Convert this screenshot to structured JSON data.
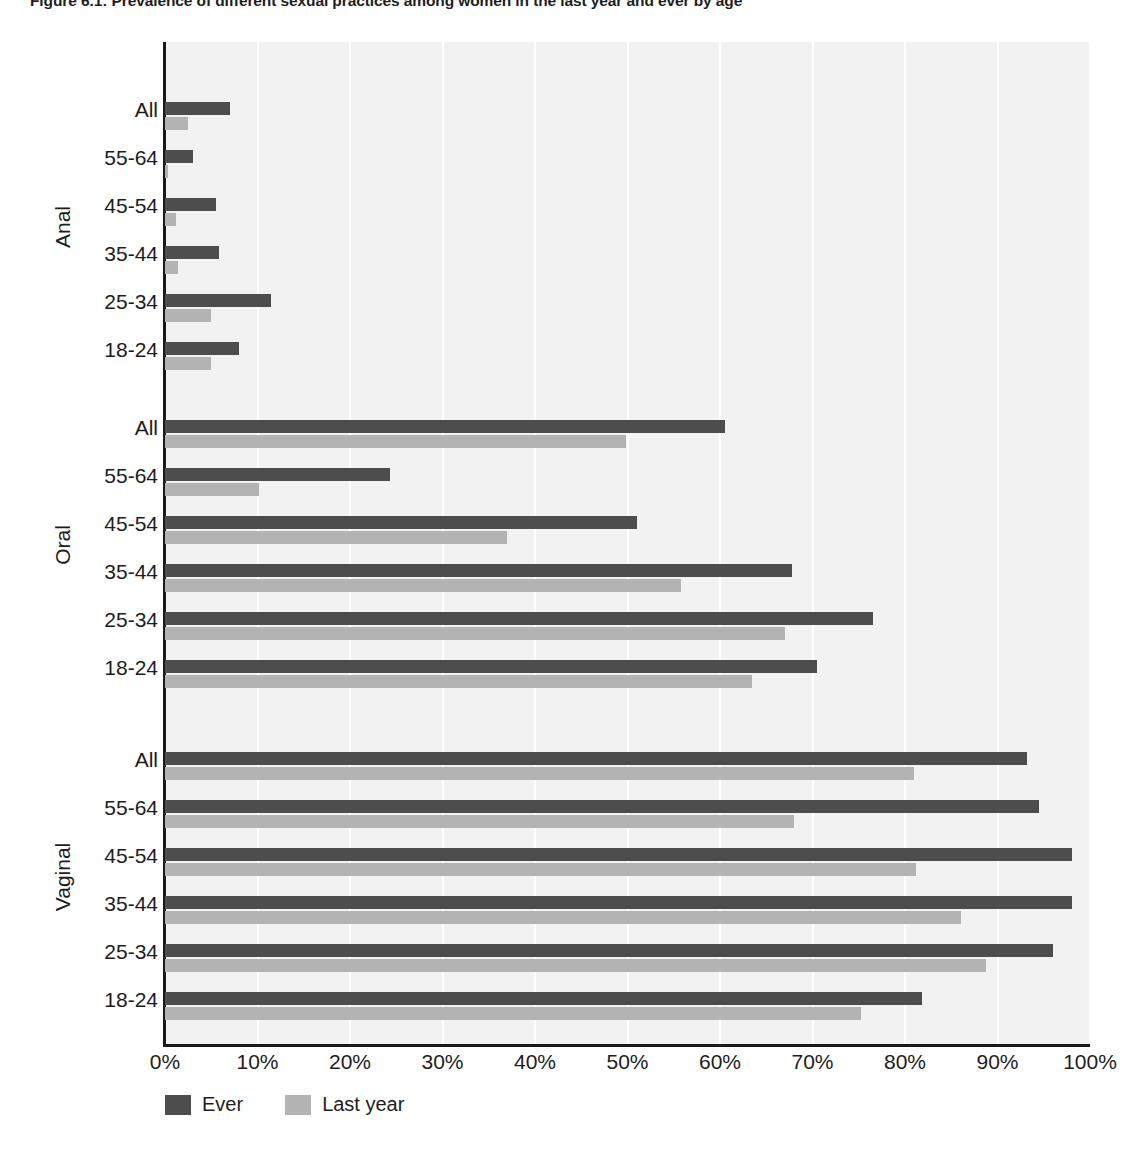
{
  "figure": {
    "title": "Figure 6.1: Prevalence of different sexual practices among women in the last year and ever by age"
  },
  "legend": {
    "series": [
      {
        "label": "Ever",
        "color": "#4d4d4d"
      },
      {
        "label": "Last year",
        "color": "#b3b3b3"
      }
    ]
  },
  "axis": {
    "x_ticks": [
      "0%",
      "10%",
      "20%",
      "30%",
      "40%",
      "50%",
      "60%",
      "70%",
      "80%",
      "90%",
      "100%"
    ],
    "x_min": 0,
    "x_max": 100
  },
  "groups": [
    {
      "name": "Anal"
    },
    {
      "name": "Oral"
    },
    {
      "name": "Vaginal"
    }
  ],
  "age_labels": [
    "All",
    "55-64",
    "45-54",
    "35-44",
    "25-34",
    "18-24"
  ],
  "chart_data": {
    "type": "bar",
    "orientation": "horizontal",
    "title": "Figure 6.1: Prevalence of different sexual practices among women in the last year and ever by age",
    "xlabel": "",
    "ylabel": "",
    "xlim": [
      0,
      100
    ],
    "xticks": [
      0,
      10,
      20,
      30,
      40,
      50,
      60,
      70,
      80,
      90,
      100
    ],
    "xtick_labels": [
      "0%",
      "10%",
      "20%",
      "30%",
      "40%",
      "50%",
      "60%",
      "70%",
      "80%",
      "90%",
      "100%"
    ],
    "grid": "vertical",
    "legend_position": "bottom-left",
    "legend_entries": [
      "Ever",
      "Last year"
    ],
    "categories": [
      "All",
      "55-64",
      "45-54",
      "35-44",
      "25-34",
      "18-24"
    ],
    "panels": [
      {
        "name": "Anal",
        "series": [
          {
            "name": "Ever",
            "color": "#4d4d4d",
            "values": [
              7.0,
              3.0,
              5.5,
              5.8,
              11.5,
              8.0
            ]
          },
          {
            "name": "Last year",
            "color": "#b3b3b3",
            "values": [
              2.5,
              0.3,
              1.2,
              1.4,
              5.0,
              5.0
            ]
          }
        ]
      },
      {
        "name": "Oral",
        "series": [
          {
            "name": "Ever",
            "color": "#4d4d4d",
            "values": [
              60.5,
              24.3,
              51.0,
              67.8,
              76.5,
              70.5
            ]
          },
          {
            "name": "Last year",
            "color": "#b3b3b3",
            "values": [
              49.8,
              10.2,
              37.0,
              55.8,
              67.0,
              63.5
            ]
          }
        ]
      },
      {
        "name": "Vaginal",
        "series": [
          {
            "name": "Ever",
            "color": "#4d4d4d",
            "values": [
              93.2,
              94.5,
              98.0,
              98.0,
              96.0,
              81.8
            ]
          },
          {
            "name": "Last year",
            "color": "#b3b3b3",
            "values": [
              81.0,
              68.0,
              81.2,
              86.0,
              88.8,
              75.2
            ]
          }
        ]
      }
    ]
  }
}
